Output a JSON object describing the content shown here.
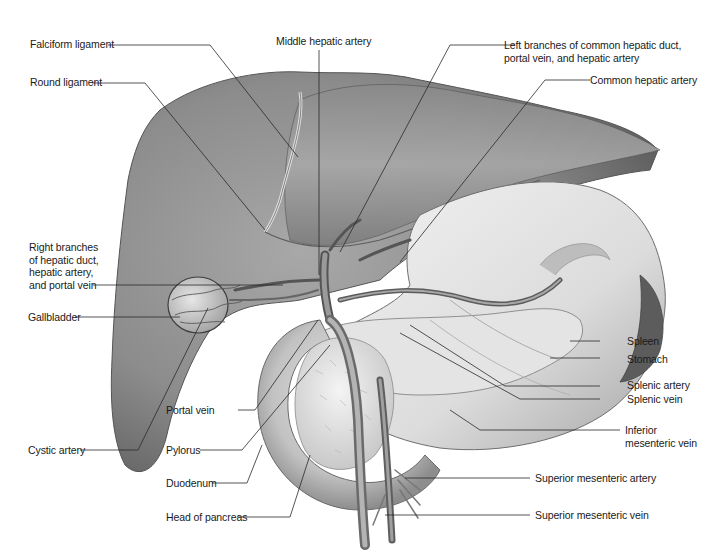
{
  "figure": {
    "style": "grayscale pencil anatomical illustration"
  },
  "labels": {
    "falciform_ligament": "Falciform ligament",
    "middle_hepatic_artery": "Middle hepatic artery",
    "left_branches": "Left branches of common hepatic duct,\nportal vein, and hepatic artery",
    "common_hepatic_artery": "Common hepatic artery",
    "round_ligament": "Round ligament",
    "right_branches": "Right branches\nof hepatic duct,\nhepatic artery,\nand portal vein",
    "gallbladder": "Gallbladder",
    "spleen": "Spleen",
    "stomach": "Stomach",
    "splenic_artery": "Splenic artery",
    "splenic_vein": "Splenic vein",
    "portal_vein": "Portal vein",
    "cystic_artery": "Cystic artery",
    "pylorus": "Pylorus",
    "inferior_mesenteric_vein": "Inferior\nmesenteric vein",
    "duodenum": "Duodenum",
    "superior_mesenteric_artery": "Superior mesenteric artery",
    "head_of_pancreas": "Head of pancreas",
    "superior_mesenteric_vein": "Superior mesenteric vein"
  },
  "colors": {
    "background": "#ffffff",
    "label_text": "#1a1a1a",
    "leader_line": "#2a2a2a",
    "organ_dark": "#6e6e6e",
    "organ_mid": "#9a9a9a",
    "organ_light": "#d8d8d8"
  }
}
